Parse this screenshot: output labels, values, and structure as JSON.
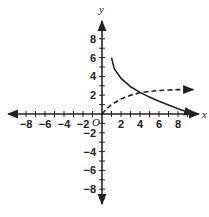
{
  "chart_data": {
    "type": "line",
    "title": "",
    "xlabel": "x",
    "ylabel": "y",
    "origin_label": "O",
    "xlim": [
      -10,
      10
    ],
    "ylim": [
      -10,
      10
    ],
    "grid": false,
    "x_ticks": [
      -8,
      -6,
      -4,
      -2,
      2,
      4,
      6,
      8
    ],
    "x_tick_labels": [
      "−8",
      "−6",
      "−4",
      "−2",
      "2",
      "4",
      "6",
      "8"
    ],
    "y_ticks": [
      8,
      6,
      4,
      2,
      -2,
      -4,
      -6,
      -8
    ],
    "y_tick_labels": [
      "8",
      "6",
      "4",
      "2",
      "−2",
      "−4",
      "−6",
      "−8"
    ],
    "series": [
      {
        "name": "solid curve",
        "style": "solid",
        "arrow_end": true,
        "x": [
          1,
          1.3,
          2,
          3,
          4,
          5,
          6,
          7,
          8,
          9,
          9.7
        ],
        "y": [
          6,
          4.8,
          3.8,
          2.9,
          2.3,
          1.8,
          1.35,
          0.95,
          0.55,
          0.2,
          0
        ]
      },
      {
        "name": "dashed curve",
        "style": "dashed",
        "arrow_end": true,
        "x": [
          0,
          0.5,
          1,
          2,
          3,
          4,
          5,
          6,
          7,
          8,
          9.6
        ],
        "y": [
          0,
          0.6,
          1,
          1.6,
          2.0,
          2.25,
          2.4,
          2.5,
          2.55,
          2.6,
          2.6
        ]
      }
    ],
    "colors": {
      "axis": "#222222",
      "curve": "#222222"
    }
  }
}
